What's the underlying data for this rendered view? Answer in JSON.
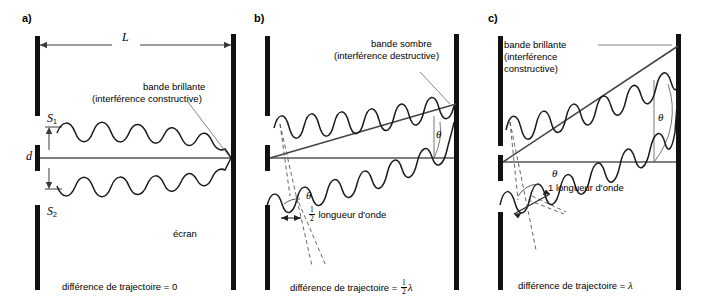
{
  "figure": {
    "language": "fr",
    "background_color": "#ffffff",
    "ink_color": "#000000",
    "line_color": "#4d4d4d"
  },
  "panels": [
    {
      "id": "a",
      "letter": "a)",
      "labels": {
        "distance_L": "L",
        "slit_top": "S",
        "slit_top_sub": "1",
        "slit_bottom": "S",
        "slit_bottom_sub": "2",
        "separation_d": "d",
        "screen": "écran",
        "band_line1": "bande brillante",
        "band_line2": "(interférence constructive)"
      },
      "caption_prefix": "différence de trajectoire = ",
      "caption_value": "0"
    },
    {
      "id": "b",
      "letter": "b)",
      "labels": {
        "band_line1": "bande sombre",
        "band_line2": "(interférence destructive)",
        "angle_upper": "θ",
        "angle_lower": "θ",
        "wavelength_measure_prefix": "",
        "wavelength_measure_frac_num": "1",
        "wavelength_measure_frac_den": "2",
        "wavelength_measure_text": " longueur d'onde"
      },
      "caption_prefix": "différence de trajectoire = ",
      "caption_frac_num": "1",
      "caption_frac_den": "2",
      "caption_lambda": "λ"
    },
    {
      "id": "c",
      "letter": "c)",
      "labels": {
        "band_line1": "bande brillante",
        "band_line2": "(interférence",
        "band_line3": "constructive)",
        "angle_upper": "θ",
        "angle_lower": "θ",
        "wavelength_measure_text": "1 longueur d'onde"
      },
      "caption_prefix": "différence de trajectoire = ",
      "caption_lambda": "λ"
    }
  ]
}
